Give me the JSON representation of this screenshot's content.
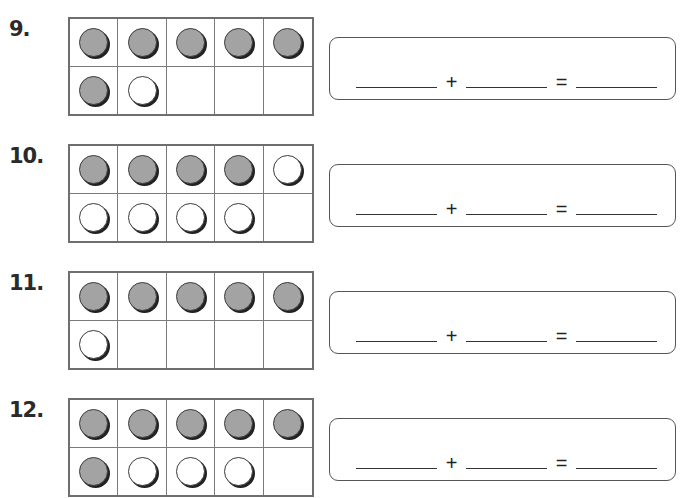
{
  "colors": {
    "filled_counter": "#a3a3a3",
    "empty_counter": "#ffffff",
    "border": "#6e6e6e"
  },
  "problems": [
    {
      "number": "9.",
      "cells": [
        "filled",
        "filled",
        "filled",
        "filled",
        "filled",
        "filled",
        "empty",
        "none",
        "none",
        "none"
      ],
      "equation": {
        "plus": "+",
        "equals": "="
      }
    },
    {
      "number": "10.",
      "cells": [
        "filled",
        "filled",
        "filled",
        "filled",
        "empty",
        "empty",
        "empty",
        "empty",
        "empty",
        "none"
      ],
      "equation": {
        "plus": "+",
        "equals": "="
      }
    },
    {
      "number": "11.",
      "cells": [
        "filled",
        "filled",
        "filled",
        "filled",
        "filled",
        "empty",
        "none",
        "none",
        "none",
        "none"
      ],
      "equation": {
        "plus": "+",
        "equals": "="
      }
    },
    {
      "number": "12.",
      "cells": [
        "filled",
        "filled",
        "filled",
        "filled",
        "filled",
        "filled",
        "empty",
        "empty",
        "empty",
        "none"
      ],
      "equation": {
        "plus": "+",
        "equals": "="
      }
    }
  ]
}
